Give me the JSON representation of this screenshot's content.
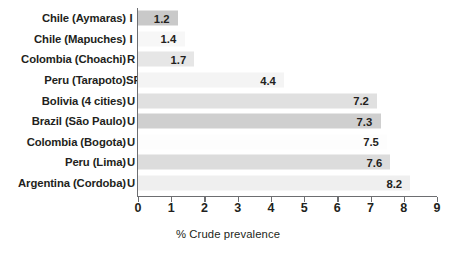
{
  "chart_data": {
    "type": "bar",
    "orientation": "horizontal",
    "title": "",
    "xlabel": "% Crude prevalence",
    "ylabel": "",
    "xlim": [
      0,
      9
    ],
    "xticks": [
      "0",
      "1",
      "2",
      "3",
      "4",
      "5",
      "6",
      "7",
      "8",
      "9"
    ],
    "grid": false,
    "legend": null,
    "categories": [
      "Chile (Aymaras)",
      "Chile (Mapuches)",
      "Colombia (Choachi)",
      "Peru (Tarapoto)",
      "Bolivia (4 cities)",
      "Brazil (São Paulo)",
      "Colombia (Bogota)",
      "Peru (Lima)",
      "Argentina (Cordoba)"
    ],
    "setting_codes": [
      "I",
      "I",
      "R",
      "SR",
      "U",
      "U",
      "U",
      "U",
      "U"
    ],
    "values": [
      1.2,
      1.4,
      1.7,
      4.4,
      7.2,
      7.3,
      7.5,
      7.6,
      8.2
    ],
    "value_labels": [
      "1.2",
      "1.4",
      "1.7",
      "4.4",
      "7.2",
      "7.3",
      "7.5",
      "7.6",
      "8.2"
    ],
    "bar_colors": [
      "#c9c9c9",
      "#f7f7f7",
      "#e6e6e6",
      "#f4f4f4",
      "#e0e0e0",
      "#cfcfcf",
      "#fdfdfd",
      "#dcdcdc",
      "#efefef"
    ]
  },
  "axis": {
    "line_color": "#6d6e71",
    "text_color": "#231f20"
  }
}
